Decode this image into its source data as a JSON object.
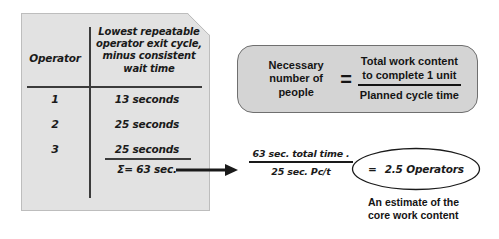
{
  "paper": {
    "table": {
      "columns": [
        "Operator",
        "Lowest repeatable operator exit cycle, minus consistent wait time"
      ],
      "column_header_operator": "Operator",
      "column_header_cycle_line1": "Lowest repeatable",
      "column_header_cycle_line2": "operator exit cycle,",
      "column_header_cycle_line3": "minus consistent",
      "column_header_cycle_line4": "wait time",
      "rows": [
        {
          "operator": "1",
          "time": "13 seconds"
        },
        {
          "operator": "2",
          "time": "25 seconds"
        },
        {
          "operator": "3",
          "time": "25 seconds"
        }
      ],
      "sum": "Σ= 63 sec."
    }
  },
  "formula_box": {
    "left_line1": "Necessary",
    "left_line2": "number of",
    "left_line3": "people",
    "equals": "=",
    "numerator_line1": "Total work content",
    "numerator_line2": "to complete 1 unit",
    "denominator": "Planned cycle time"
  },
  "calculation": {
    "numerator": "63 sec. total time .",
    "denominator": "25 sec. Pc/t",
    "equals": "=",
    "result": "2.5 Operators",
    "caption_line1": "An estimate of the",
    "caption_line2": "core work content"
  },
  "icons": {
    "arrow": "right-arrow-icon",
    "page_fold": "page-fold-corner-icon"
  },
  "colors": {
    "paper_fill": "#e2e2e2",
    "paper_border": "#bdbdbd",
    "box_fill": "#d4d4d4",
    "box_border": "#6f6f6f",
    "ink": "#1a1a1a",
    "background": "#ffffff"
  }
}
